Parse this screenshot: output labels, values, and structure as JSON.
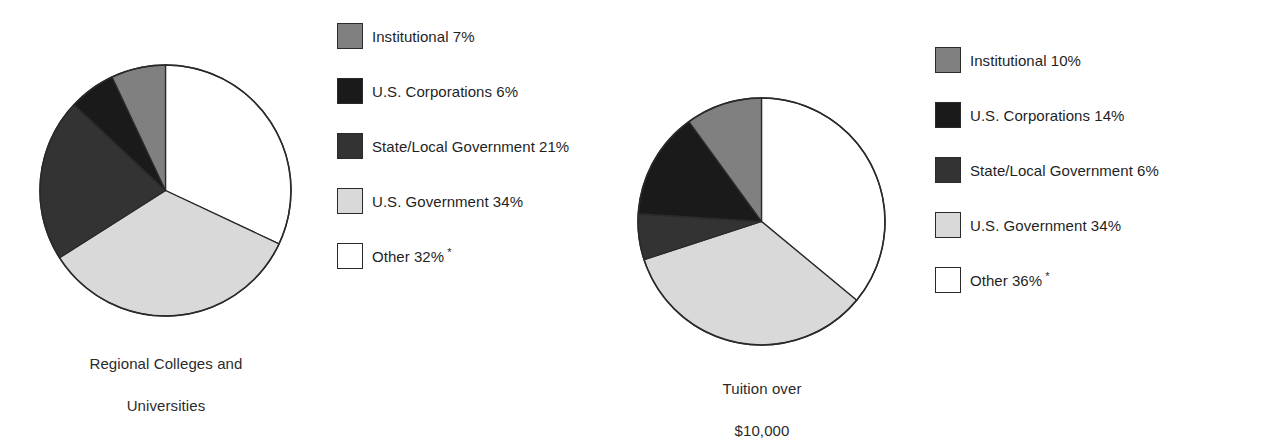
{
  "figure": {
    "background_color": "#ffffff",
    "series_colors": {
      "institutional": "#808080",
      "us_corporations": "#1a1a1a",
      "state_local_government": "#333333",
      "us_government": "#d9d9d9",
      "other": "#ffffff",
      "outline": "#2a2a2a"
    },
    "footnote_marker": "*"
  },
  "chart_data": [
    {
      "type": "pie",
      "title": "Regional Colleges and\nUniversities",
      "caption_line1": "Regional Colleges and",
      "caption_line2": "Universities",
      "start_angle_deg": 0,
      "direction": "clockwise",
      "categories": [
        "Other",
        "U.S. Government",
        "State/Local Government",
        "U.S. Corporations",
        "Institutional"
      ],
      "values": [
        32,
        34,
        21,
        6,
        7
      ],
      "colors": [
        "#ffffff",
        "#d9d9d9",
        "#333333",
        "#1a1a1a",
        "#808080"
      ],
      "legend_position": "right",
      "legend": [
        {
          "label": "Institutional 7%",
          "name": "Institutional",
          "value": 7,
          "color": "#808080",
          "note": ""
        },
        {
          "label": "U.S. Corporations 6%",
          "name": "U.S. Corporations",
          "value": 6,
          "color": "#1a1a1a",
          "note": ""
        },
        {
          "label": "State/Local Government 21%",
          "name": "State/Local Government",
          "value": 21,
          "color": "#333333",
          "note": ""
        },
        {
          "label": "U.S. Government 34%",
          "name": "U.S. Government",
          "value": 34,
          "color": "#d9d9d9",
          "note": ""
        },
        {
          "label": "Other 32%",
          "name": "Other",
          "value": 32,
          "color": "#ffffff",
          "note": "*"
        }
      ]
    },
    {
      "type": "pie",
      "title": "Tuition over\n$10,000",
      "caption_line1": "Tuition over",
      "caption_line2": "$10,000",
      "start_angle_deg": 0,
      "direction": "clockwise",
      "categories": [
        "Other",
        "U.S. Government",
        "State/Local Government",
        "U.S. Corporations",
        "Institutional"
      ],
      "values": [
        36,
        34,
        6,
        14,
        10
      ],
      "colors": [
        "#ffffff",
        "#d9d9d9",
        "#333333",
        "#1a1a1a",
        "#808080"
      ],
      "legend_position": "right",
      "legend": [
        {
          "label": "Institutional 10%",
          "name": "Institutional",
          "value": 10,
          "color": "#808080",
          "note": ""
        },
        {
          "label": "U.S. Corporations 14%",
          "name": "U.S. Corporations",
          "value": 14,
          "color": "#1a1a1a",
          "note": ""
        },
        {
          "label": "State/Local Government 6%",
          "name": "State/Local Government",
          "value": 6,
          "color": "#333333",
          "note": ""
        },
        {
          "label": "U.S. Government 34%",
          "name": "U.S. Government",
          "value": 34,
          "color": "#d9d9d9",
          "note": ""
        },
        {
          "label": "Other 36%",
          "name": "Other",
          "value": 36,
          "color": "#ffffff",
          "note": "*"
        }
      ]
    }
  ]
}
